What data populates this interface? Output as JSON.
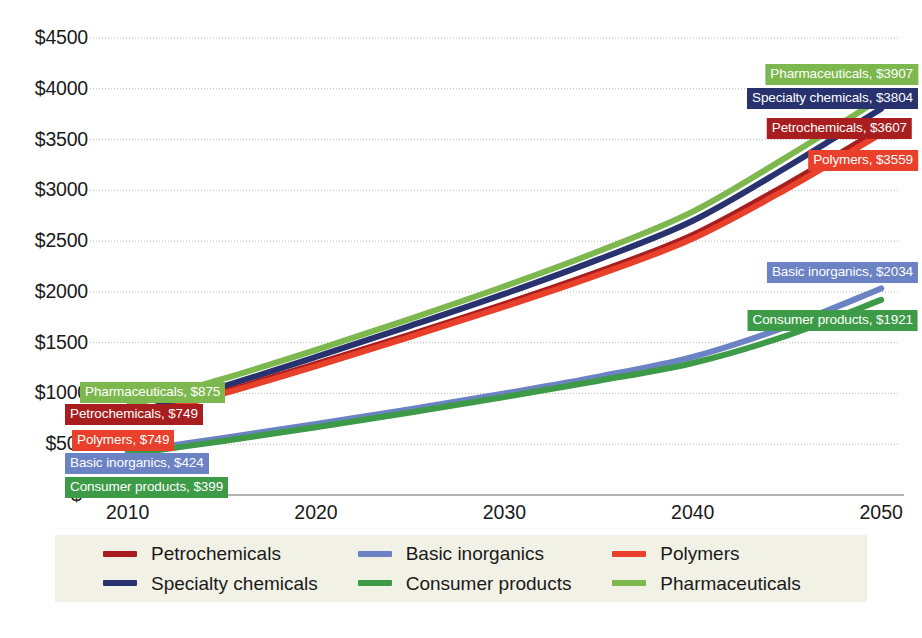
{
  "chart_data": {
    "type": "line",
    "title": "",
    "xlabel": "",
    "ylabel": "",
    "x": [
      2010,
      2015,
      2020,
      2025,
      2030,
      2035,
      2040,
      2045,
      2050
    ],
    "xlim": [
      2008,
      2051
    ],
    "ylim": [
      0,
      4700
    ],
    "grid": true,
    "legend_position": "bottom",
    "xticks": [
      "2010",
      "2020",
      "2030",
      "2040",
      "2050"
    ],
    "yticks": [
      "$-",
      "$500",
      "$1000",
      "$1500",
      "$2000",
      "$2500",
      "$3000",
      "$3500",
      "$4000",
      "$4500"
    ],
    "ytick_values": [
      0,
      500,
      1000,
      1500,
      2000,
      2500,
      3000,
      3500,
      4000,
      4500
    ],
    "series": [
      {
        "name": "Petrochemicals",
        "color": "#a81e1e",
        "start_value": 749,
        "end_value": 3607,
        "values": [
          749,
          1010,
          1290,
          1580,
          1880,
          2200,
          2560,
          3060,
          3607
        ]
      },
      {
        "name": "Specialty chemicals",
        "color": "#27326e",
        "start_value": 875,
        "end_value": 3804,
        "values": [
          790,
          1065,
          1360,
          1665,
          1980,
          2320,
          2700,
          3230,
          3804
        ]
      },
      {
        "name": "Polymers",
        "color": "#e8402a",
        "start_value": 749,
        "end_value": 3559,
        "values": [
          740,
          995,
          1270,
          1558,
          1855,
          2170,
          2525,
          3015,
          3559
        ]
      },
      {
        "name": "Basic inorganics",
        "color": "#6b82c4",
        "start_value": 424,
        "end_value": 2034,
        "values": [
          424,
          560,
          700,
          845,
          1000,
          1165,
          1360,
          1660,
          2034
        ]
      },
      {
        "name": "Consumer products",
        "color": "#3d9b48",
        "start_value": 399,
        "end_value": 1921,
        "values": [
          399,
          530,
          668,
          812,
          965,
          1125,
          1300,
          1570,
          1921
        ]
      },
      {
        "name": "Pharmaceuticals",
        "color": "#7db84f",
        "start_value": 875,
        "end_value": 3907,
        "values": [
          875,
          1140,
          1430,
          1735,
          2055,
          2400,
          2790,
          3330,
          3907
        ]
      }
    ],
    "point_labels": [
      {
        "id": "pharmaceuticals-start",
        "text": "Pharmaceuticals, $875",
        "color": "#7db84f",
        "side": "left"
      },
      {
        "id": "petrochemicals-start",
        "text": "Petrochemicals, $749",
        "color": "#a81e1e",
        "side": "left"
      },
      {
        "id": "polymers-start",
        "text": "Polymers, $749",
        "color": "#e8402a",
        "side": "left"
      },
      {
        "id": "basic-inorganics-start",
        "text": "Basic inorganics, $424",
        "color": "#6b82c4",
        "side": "left"
      },
      {
        "id": "consumer-products-start",
        "text": "Consumer products,  $399",
        "color": "#3d9b48",
        "side": "left"
      },
      {
        "id": "pharmaceuticals-end",
        "text": "Pharmaceuticals, $3907",
        "color": "#7db84f",
        "side": "right"
      },
      {
        "id": "specialty-chemicals-end",
        "text": "Specialty chemicals, $3804",
        "color": "#27326e",
        "side": "right"
      },
      {
        "id": "petrochemicals-end",
        "text": "Petrochemicals, $3607",
        "color": "#a81e1e",
        "side": "right"
      },
      {
        "id": "polymers-end",
        "text": "Polymers, $3559",
        "color": "#e8402a",
        "side": "right"
      },
      {
        "id": "basic-inorganics-end",
        "text": "Basic inorganics, $2034",
        "color": "#6b82c4",
        "side": "right"
      },
      {
        "id": "consumer-products-end",
        "text": "Consumer products, $1921",
        "color": "#3d9b48",
        "side": "right"
      }
    ],
    "legend": [
      {
        "name": "Petrochemicals",
        "color": "#a81e1e"
      },
      {
        "name": "Basic inorganics",
        "color": "#6b82c4"
      },
      {
        "name": "Polymers",
        "color": "#e8402a"
      },
      {
        "name": "Specialty chemicals",
        "color": "#27326e"
      },
      {
        "name": "Consumer products",
        "color": "#3d9b48"
      },
      {
        "name": "Pharmaceuticals",
        "color": "#7db84f"
      }
    ],
    "legend_background": "#f2f1e6",
    "gridline_color": "#b8b8b8",
    "axis_color": "#9a9a9a"
  }
}
